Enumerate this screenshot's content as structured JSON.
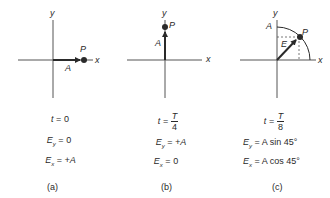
{
  "panels": [
    {
      "id": "a",
      "caption": "(a)",
      "axis_labels": {
        "x": "x",
        "y": "y"
      },
      "vector_label": "A",
      "point_label": "P",
      "t_lhs": "t",
      "t_value": "0",
      "ey_lhs": "E",
      "ey_sub": "y",
      "ey_value": "0",
      "ex_lhs": "E",
      "ex_sub": "x",
      "ex_value": "+A"
    },
    {
      "id": "b",
      "caption": "(b)",
      "axis_labels": {
        "x": "x",
        "y": "y"
      },
      "vector_label": "A",
      "point_label": "P",
      "t_lhs": "t",
      "t_num": "T",
      "t_den": "4",
      "ey_lhs": "E",
      "ey_sub": "y",
      "ey_value": "+A",
      "ex_lhs": "E",
      "ex_sub": "x",
      "ex_value": "0"
    },
    {
      "id": "c",
      "caption": "(c)",
      "axis_labels": {
        "x": "x",
        "y": "y"
      },
      "amplitude_label": "A",
      "vector_label": "E",
      "point_label": "P",
      "t_lhs": "t",
      "t_num": "T",
      "t_den": "8",
      "ey_lhs": "E",
      "ey_sub": "y",
      "ey_value": "A sin 45°",
      "ex_lhs": "E",
      "ex_sub": "x",
      "ex_value": "A cos 45°"
    }
  ],
  "colors": {
    "ink": "#2a2a2a",
    "axis": "#555555"
  }
}
